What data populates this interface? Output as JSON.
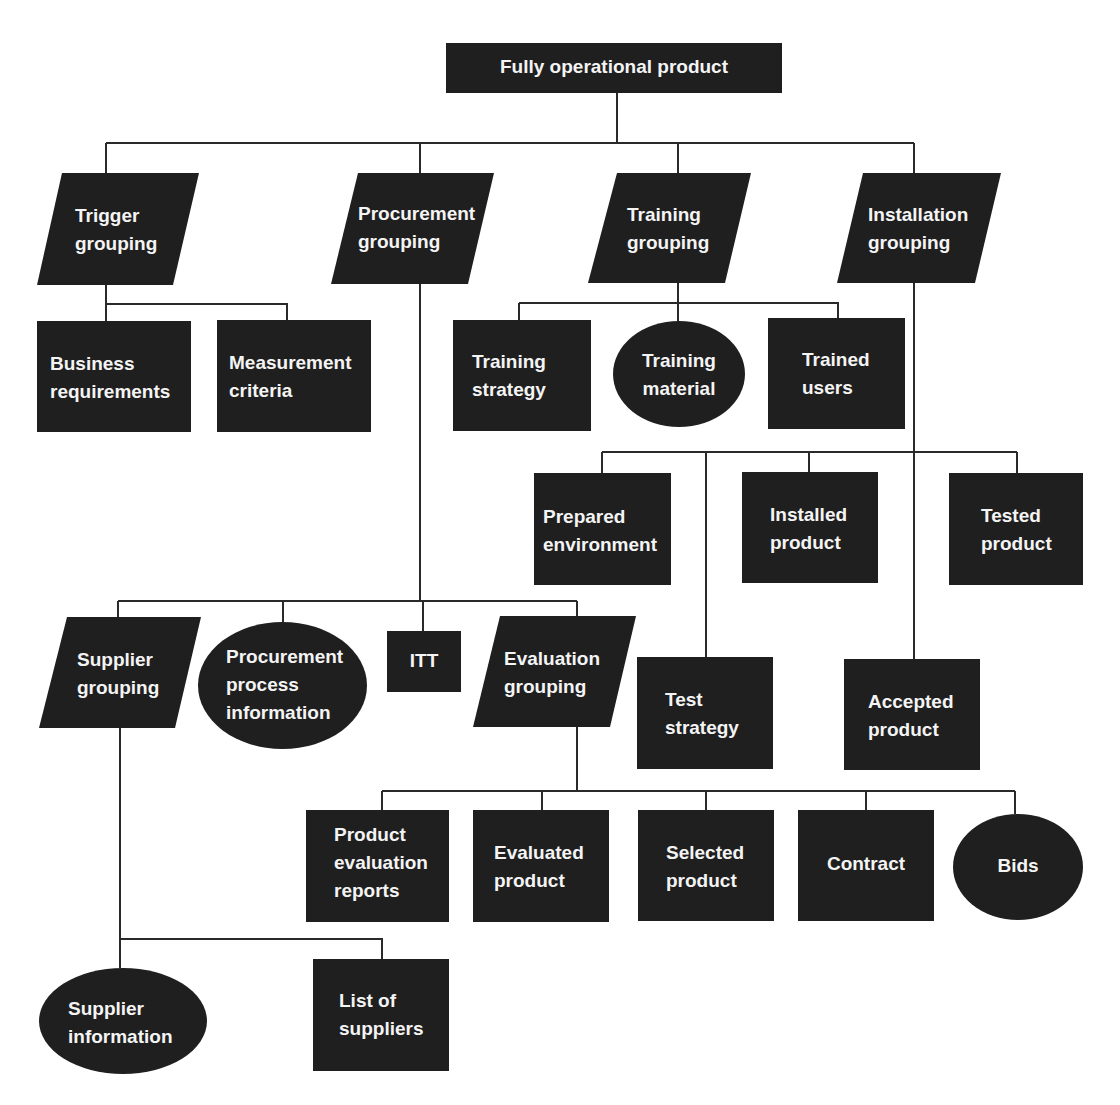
{
  "diagram": {
    "title": "Fully operational product",
    "colors": {
      "node_fill": "#1f1f1f",
      "node_text": "#f4f4f4",
      "line": "#2a2a2a",
      "background": "#ffffff"
    },
    "legend_shapes": {
      "rectangle": "product",
      "parallelogram": "grouping",
      "ellipse": "external product"
    },
    "nodes": [
      {
        "id": "root",
        "shape": "rect",
        "x": 446,
        "y": 43,
        "w": 336,
        "h": 50,
        "lines": [
          "Fully operational product"
        ],
        "align": "center"
      },
      {
        "id": "trigger",
        "shape": "para",
        "top": [
          62,
          199
        ],
        "bottom": [
          37,
          173
        ],
        "y": 173,
        "y2": 285,
        "lines": [
          "Trigger",
          "grouping"
        ],
        "tx": 75,
        "ty": 222
      },
      {
        "id": "procurement",
        "shape": "para",
        "top": [
          358,
          494
        ],
        "bottom": [
          331,
          468
        ],
        "y": 173,
        "y2": 284,
        "lines": [
          "Procurement",
          "grouping"
        ],
        "tx": 358,
        "ty": 220
      },
      {
        "id": "training",
        "shape": "para",
        "top": [
          617,
          751
        ],
        "bottom": [
          588,
          725
        ],
        "y": 173,
        "y2": 283,
        "lines": [
          "Training",
          "grouping"
        ],
        "tx": 627,
        "ty": 221
      },
      {
        "id": "installation",
        "shape": "para",
        "top": [
          863,
          1001
        ],
        "bottom": [
          837,
          975
        ],
        "y": 173,
        "y2": 283,
        "lines": [
          "Installation",
          "grouping"
        ],
        "tx": 868,
        "ty": 221
      },
      {
        "id": "business-requirements",
        "shape": "rect",
        "x": 37,
        "y": 321,
        "w": 154,
        "h": 111,
        "lines": [
          "Business",
          "requirements"
        ],
        "tx": 50,
        "ty": 370
      },
      {
        "id": "measurement-criteria",
        "shape": "rect",
        "x": 217,
        "y": 320,
        "w": 154,
        "h": 112,
        "lines": [
          "Measurement",
          "criteria"
        ],
        "tx": 229,
        "ty": 369
      },
      {
        "id": "training-strategy",
        "shape": "rect",
        "x": 453,
        "y": 320,
        "w": 138,
        "h": 111,
        "lines": [
          "Training",
          "strategy"
        ],
        "tx": 472,
        "ty": 368
      },
      {
        "id": "training-material",
        "shape": "ellipse",
        "x": 613,
        "y": 321,
        "w": 132,
        "h": 106,
        "lines": [
          "Training",
          "material"
        ],
        "align": "center",
        "ty": 367
      },
      {
        "id": "trained-users",
        "shape": "rect",
        "x": 768,
        "y": 318,
        "w": 137,
        "h": 111,
        "lines": [
          "Trained",
          "users"
        ],
        "tx": 802,
        "ty": 366
      },
      {
        "id": "prepared-environment",
        "shape": "rect",
        "x": 534,
        "y": 473,
        "w": 137,
        "h": 112,
        "lines": [
          "Prepared",
          "environment"
        ],
        "tx": 543,
        "ty": 523
      },
      {
        "id": "installed-product",
        "shape": "rect",
        "x": 742,
        "y": 472,
        "w": 136,
        "h": 111,
        "lines": [
          "Installed",
          "product"
        ],
        "tx": 770,
        "ty": 521
      },
      {
        "id": "tested-product",
        "shape": "rect",
        "x": 949,
        "y": 473,
        "w": 134,
        "h": 112,
        "lines": [
          "Tested",
          "product"
        ],
        "tx": 981,
        "ty": 522
      },
      {
        "id": "supplier-grouping",
        "shape": "para",
        "top": [
          67,
          201
        ],
        "bottom": [
          39,
          175
        ],
        "y": 617,
        "y2": 728,
        "lines": [
          "Supplier",
          "grouping"
        ],
        "tx": 77,
        "ty": 666
      },
      {
        "id": "procurement-process-information",
        "shape": "ellipse",
        "x": 198,
        "y": 622,
        "w": 169,
        "h": 127,
        "lines": [
          "Procurement",
          "process",
          "information"
        ],
        "tx": 226,
        "ty": 663
      },
      {
        "id": "itt",
        "shape": "rect",
        "x": 387,
        "y": 631,
        "w": 74,
        "h": 61,
        "lines": [
          "ITT"
        ],
        "align": "center",
        "ty": 667
      },
      {
        "id": "evaluation-grouping",
        "shape": "para",
        "top": [
          500,
          636
        ],
        "bottom": [
          473,
          610
        ],
        "y": 616,
        "y2": 727,
        "lines": [
          "Evaluation",
          "grouping"
        ],
        "tx": 504,
        "ty": 665
      },
      {
        "id": "test-strategy",
        "shape": "rect",
        "x": 637,
        "y": 657,
        "w": 136,
        "h": 112,
        "lines": [
          "Test",
          "strategy"
        ],
        "tx": 665,
        "ty": 706
      },
      {
        "id": "accepted-product",
        "shape": "rect",
        "x": 844,
        "y": 659,
        "w": 136,
        "h": 111,
        "lines": [
          "Accepted",
          "product"
        ],
        "tx": 868,
        "ty": 708
      },
      {
        "id": "product-evaluation-reports",
        "shape": "rect",
        "x": 306,
        "y": 810,
        "w": 143,
        "h": 112,
        "lines": [
          "Product",
          "evaluation",
          "reports"
        ],
        "tx": 334,
        "ty": 841
      },
      {
        "id": "evaluated-product",
        "shape": "rect",
        "x": 473,
        "y": 810,
        "w": 136,
        "h": 112,
        "lines": [
          "Evaluated",
          "product"
        ],
        "tx": 494,
        "ty": 859
      },
      {
        "id": "selected-product",
        "shape": "rect",
        "x": 638,
        "y": 810,
        "w": 136,
        "h": 111,
        "lines": [
          "Selected",
          "product"
        ],
        "tx": 666,
        "ty": 859
      },
      {
        "id": "contract",
        "shape": "rect",
        "x": 798,
        "y": 810,
        "w": 136,
        "h": 111,
        "lines": [
          "Contract"
        ],
        "align": "center",
        "ty": 870
      },
      {
        "id": "bids",
        "shape": "ellipse",
        "x": 953,
        "y": 814,
        "w": 130,
        "h": 106,
        "lines": [
          "Bids"
        ],
        "align": "center",
        "ty": 872
      },
      {
        "id": "supplier-information",
        "shape": "ellipse",
        "x": 39,
        "y": 968,
        "w": 168,
        "h": 106,
        "lines": [
          "Supplier",
          "information"
        ],
        "tx": 68,
        "ty": 1015
      },
      {
        "id": "list-of-suppliers",
        "shape": "rect",
        "x": 313,
        "y": 959,
        "w": 136,
        "h": 112,
        "lines": [
          "List of",
          "suppliers"
        ],
        "tx": 339,
        "ty": 1007
      }
    ],
    "connectors": [
      "M617 93 V143",
      "M106 143 H914",
      "M106 143 V173",
      "M420 143 V173",
      "M678 143 V173",
      "M914 143 V173",
      "M106 285 V321",
      "M106 304 H287 V320",
      "M678 283 V321",
      "M519 303 H838 V318",
      "M519 303 V320",
      "M914 283 V659",
      "M602 452 H1017",
      "M602 452 V473",
      "M809 452 V472",
      "M1017 452 V473",
      "M706 452 V657",
      "M420 284 V601",
      "M118 601 H577",
      "M118 601 V617",
      "M283 601 V622",
      "M423 601 V631",
      "M577 601 V616",
      "M577 727 V791",
      "M382 791 H1015",
      "M382 791 V810",
      "M542 791 V810",
      "M706 791 V810",
      "M866 791 V810",
      "M1015 791 V814",
      "M120 728 V968",
      "M120 939 H382 V959"
    ]
  }
}
